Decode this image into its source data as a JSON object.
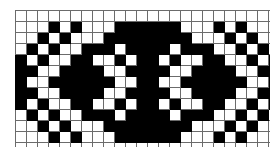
{
  "image": {
    "kind": "pattern-chart",
    "title": "Symmetric ornamental grid motif",
    "background_color": "#ffffff"
  },
  "chart_data": {
    "type": "heatmap",
    "subtitle": "",
    "xlabel": "",
    "ylabel": "",
    "columns": 24,
    "rows": 12,
    "cell_size_px": 10,
    "grid": true,
    "legend": [
      {
        "label": "filled",
        "value": 1,
        "color": "#000000"
      },
      {
        "label": "empty",
        "value": 0,
        "color": "#ffffff"
      }
    ],
    "colors": {
      "filled": "#000000",
      "empty": "#ffffff",
      "gridline": "#6b6b6b",
      "background": "#ffffff"
    },
    "values": [
      [
        0,
        0,
        0,
        0,
        0,
        0,
        0,
        0,
        0,
        0,
        0,
        0,
        0,
        0,
        0,
        0,
        0,
        0,
        0,
        0,
        0,
        0,
        0,
        0
      ],
      [
        0,
        0,
        0,
        1,
        0,
        1,
        0,
        0,
        0,
        1,
        1,
        1,
        1,
        1,
        1,
        0,
        0,
        0,
        1,
        0,
        1,
        0,
        0,
        0
      ],
      [
        0,
        0,
        1,
        0,
        1,
        0,
        0,
        0,
        1,
        1,
        1,
        1,
        1,
        1,
        1,
        1,
        0,
        0,
        0,
        1,
        0,
        1,
        0,
        0
      ],
      [
        0,
        1,
        0,
        1,
        0,
        0,
        1,
        1,
        1,
        0,
        1,
        1,
        1,
        1,
        0,
        1,
        1,
        1,
        0,
        0,
        1,
        0,
        1,
        0
      ],
      [
        1,
        0,
        1,
        0,
        0,
        1,
        1,
        0,
        0,
        1,
        0,
        1,
        1,
        0,
        1,
        0,
        0,
        1,
        1,
        0,
        0,
        1,
        0,
        1
      ],
      [
        1,
        1,
        0,
        0,
        1,
        1,
        1,
        1,
        0,
        0,
        1,
        1,
        1,
        1,
        0,
        0,
        1,
        1,
        1,
        1,
        0,
        0,
        1,
        1
      ],
      [
        1,
        0,
        0,
        1,
        1,
        1,
        1,
        1,
        1,
        0,
        0,
        1,
        1,
        0,
        0,
        1,
        1,
        1,
        1,
        1,
        1,
        0,
        0,
        1
      ],
      [
        1,
        1,
        0,
        0,
        1,
        1,
        1,
        1,
        0,
        0,
        1,
        1,
        1,
        1,
        0,
        0,
        1,
        1,
        1,
        1,
        0,
        0,
        1,
        1
      ],
      [
        1,
        0,
        1,
        0,
        0,
        1,
        1,
        0,
        0,
        1,
        0,
        1,
        1,
        0,
        1,
        0,
        0,
        1,
        1,
        0,
        0,
        1,
        0,
        1
      ],
      [
        0,
        1,
        0,
        1,
        0,
        0,
        1,
        1,
        1,
        0,
        1,
        1,
        1,
        1,
        0,
        1,
        1,
        1,
        0,
        0,
        1,
        0,
        1,
        0
      ],
      [
        0,
        0,
        1,
        0,
        1,
        0,
        0,
        0,
        1,
        1,
        1,
        1,
        1,
        1,
        1,
        1,
        0,
        0,
        0,
        1,
        0,
        1,
        0,
        0
      ],
      [
        0,
        0,
        0,
        1,
        0,
        1,
        0,
        0,
        0,
        1,
        1,
        1,
        1,
        1,
        1,
        0,
        0,
        0,
        1,
        0,
        1,
        0,
        0,
        0
      ],
      [
        0,
        0,
        0,
        0,
        0,
        0,
        0,
        0,
        0,
        0,
        0,
        0,
        0,
        0,
        0,
        0,
        0,
        0,
        0,
        0,
        0,
        0,
        0,
        0
      ]
    ]
  }
}
